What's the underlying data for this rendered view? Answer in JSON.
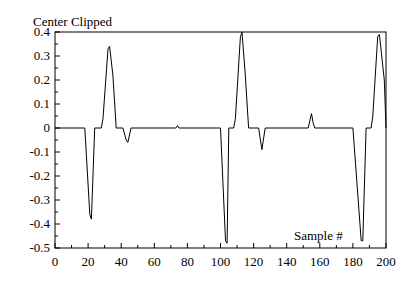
{
  "chart_data": {
    "type": "line",
    "title": "Center Clipped",
    "xlabel": "Sample #",
    "ylabel": "",
    "xlim": [
      0,
      200
    ],
    "ylim": [
      -0.5,
      0.4
    ],
    "grid": false,
    "legend": null,
    "x_ticks": [
      0,
      20,
      40,
      60,
      80,
      100,
      120,
      140,
      160,
      180,
      200
    ],
    "x_tick_labels": [
      "0",
      "20",
      "40",
      "60",
      "80",
      "100",
      "120",
      "140",
      "160",
      "180",
      "200"
    ],
    "y_ticks": [
      0.4,
      0.3,
      0.2,
      0.1,
      0,
      -0.1,
      -0.2,
      -0.3,
      -0.4,
      -0.5
    ],
    "y_tick_labels": [
      "0.4",
      "0.3",
      "0.2",
      "0.1",
      "0",
      "-0.1",
      "-0.2",
      "-0.3",
      "-0.4",
      "-0.5"
    ],
    "series": [
      {
        "name": "Center Clipped",
        "color": "#000000",
        "points": [
          [
            0,
            0
          ],
          [
            18,
            0
          ],
          [
            21,
            -0.36
          ],
          [
            22,
            -0.38
          ],
          [
            24,
            0
          ],
          [
            28,
            0
          ],
          [
            29,
            0.04
          ],
          [
            32,
            0.33
          ],
          [
            33,
            0.34
          ],
          [
            35,
            0.22
          ],
          [
            37,
            0
          ],
          [
            41,
            0
          ],
          [
            43,
            -0.05
          ],
          [
            44,
            -0.06
          ],
          [
            46,
            0
          ],
          [
            73,
            0
          ],
          [
            74,
            0.01
          ],
          [
            75,
            0
          ],
          [
            100,
            0
          ],
          [
            103,
            -0.47
          ],
          [
            104,
            -0.48
          ],
          [
            105,
            0
          ],
          [
            108,
            0
          ],
          [
            109,
            0.04
          ],
          [
            112,
            0.38
          ],
          [
            113,
            0.4
          ],
          [
            115,
            0.22
          ],
          [
            117,
            0
          ],
          [
            123,
            0
          ],
          [
            125,
            -0.09
          ],
          [
            127,
            0
          ],
          [
            153,
            0
          ],
          [
            155,
            0.06
          ],
          [
            156,
            0.02
          ],
          [
            157,
            0
          ],
          [
            180,
            0
          ],
          [
            185,
            -0.47
          ],
          [
            186,
            -0.47
          ],
          [
            188,
            0
          ],
          [
            191,
            0
          ],
          [
            192,
            0.05
          ],
          [
            195,
            0.38
          ],
          [
            196,
            0.39
          ],
          [
            199,
            0.2
          ],
          [
            200,
            0
          ]
        ]
      }
    ]
  }
}
